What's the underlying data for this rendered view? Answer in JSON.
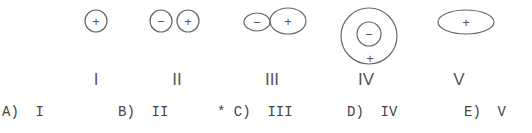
{
  "figures": [
    {
      "id": "I",
      "label": "I",
      "cx": 96
    },
    {
      "id": "II",
      "label": "II",
      "cx": 174
    },
    {
      "id": "III",
      "label": "III",
      "cx": 272
    },
    {
      "id": "IV",
      "label": "IV",
      "cx": 366
    },
    {
      "id": "V",
      "label": "V",
      "cx": 459
    }
  ],
  "signs": {
    "plus": "+",
    "minus": "−"
  },
  "answers": [
    {
      "text": "A)  I",
      "x": 2
    },
    {
      "text": "B)  II",
      "x": 118
    },
    {
      "text": "* C)  III",
      "x": 217
    },
    {
      "text": "D)  IV",
      "x": 347
    },
    {
      "text": "E)  V",
      "x": 464
    }
  ],
  "colors": {
    "stroke": "#666666",
    "text": "#444444"
  }
}
